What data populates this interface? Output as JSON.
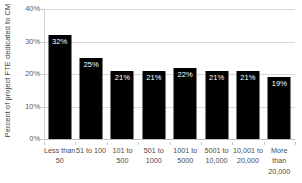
{
  "chart_data": {
    "type": "bar",
    "title": "",
    "xlabel": "",
    "ylabel": "Percent of project FTE dedicated to CM",
    "categories": [
      "Less than 50",
      "51 to 100",
      "101 to 500",
      "501 to 1000",
      "1001 to 5000",
      "5001 to 10,000",
      "10,001 to 20,000",
      "More than 20,000"
    ],
    "values": [
      32,
      25,
      21,
      21,
      22,
      21,
      21,
      19
    ],
    "data_labels": [
      "32%",
      "25%",
      "21%",
      "21%",
      "22%",
      "21%",
      "21%",
      "19%"
    ],
    "ylim": [
      0,
      40
    ],
    "y_ticks": [
      0,
      10,
      20,
      30,
      40
    ],
    "y_tick_labels": [
      "0%",
      "10%",
      "20%",
      "30%",
      "40%"
    ],
    "grid": true,
    "legend": false,
    "bar_color": "#000000",
    "data_label_color": "#ffffff",
    "gridline_color": "#d9d9d9",
    "background_color": "#ffffff"
  }
}
